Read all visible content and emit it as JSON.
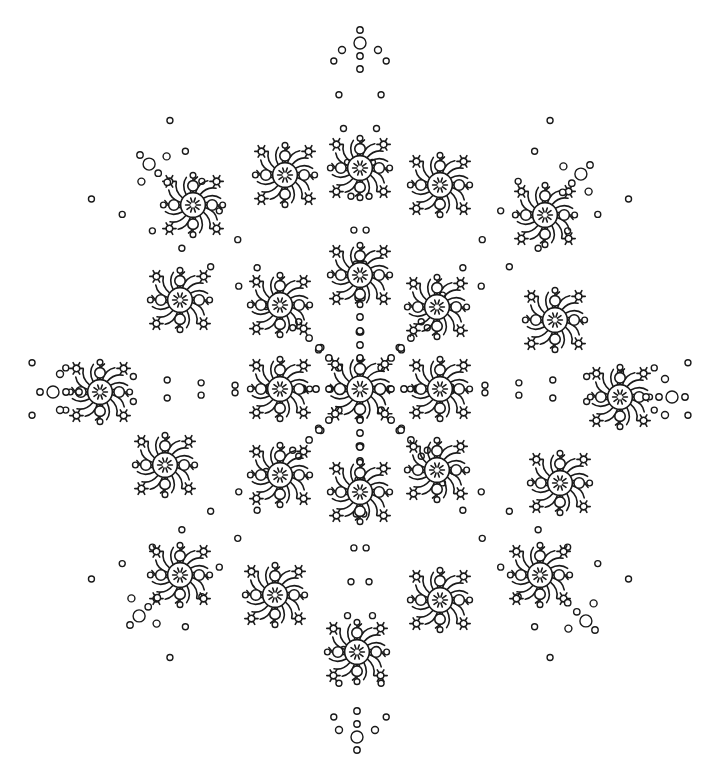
{
  "image": {
    "description": "Line-art snowflake mandala coloring page",
    "background": "#ffffff",
    "stroke_color": "#1a1a1a",
    "center": [
      360,
      389
    ]
  },
  "motifs": {
    "large_flowers": [
      [
        360,
        389
      ],
      [
        360,
        275
      ],
      [
        360,
        492
      ],
      [
        440,
        389
      ],
      [
        280,
        389
      ],
      [
        437,
        307
      ],
      [
        280,
        305
      ],
      [
        437,
        470
      ],
      [
        280,
        475
      ],
      [
        193,
        205
      ],
      [
        285,
        175
      ],
      [
        440,
        185
      ],
      [
        545,
        215
      ],
      [
        180,
        300
      ],
      [
        555,
        320
      ],
      [
        100,
        392
      ],
      [
        620,
        397
      ],
      [
        165,
        465
      ],
      [
        560,
        483
      ],
      [
        180,
        575
      ],
      [
        275,
        595
      ],
      [
        440,
        600
      ],
      [
        540,
        575
      ],
      [
        360,
        168
      ],
      [
        357,
        652
      ]
    ],
    "tips": [
      {
        "x": 360,
        "y": 30,
        "dir": "up"
      },
      {
        "x": 40,
        "y": 392,
        "dir": "left"
      },
      {
        "x": 685,
        "y": 397,
        "dir": "right"
      },
      {
        "x": 357,
        "y": 750,
        "dir": "down"
      },
      {
        "x": 140,
        "y": 155,
        "dir": "up-left"
      },
      {
        "x": 590,
        "y": 165,
        "dir": "up-right"
      },
      {
        "x": 130,
        "y": 625,
        "dir": "down-left"
      },
      {
        "x": 595,
        "y": 630,
        "dir": "down-right"
      }
    ]
  }
}
